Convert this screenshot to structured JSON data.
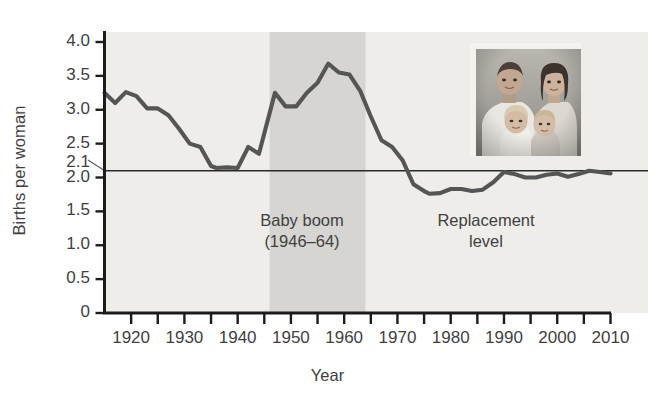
{
  "figure": {
    "background_color": "#ffffff",
    "plot_background_color": "#eeedea",
    "band_color": "#d6d5d2",
    "line_color": "#555555",
    "axis_color": "#1c1c1c",
    "text_color": "#3f3f3f"
  },
  "axis_titles": {
    "x": "Year",
    "y": "Births per woman"
  },
  "annotations": {
    "baby_boom_line1": "Baby boom",
    "baby_boom_line2": "(1946–64)",
    "replacement_line1": "Replacement",
    "replacement_line2": "level"
  },
  "photo": {
    "name": "family-portrait-photo",
    "caption": ""
  },
  "chart_data": {
    "type": "line",
    "title": "",
    "xlabel": "Year",
    "ylabel": "Births per woman",
    "xlim": [
      1915,
      2010
    ],
    "ylim": [
      0,
      4.2
    ],
    "grid": false,
    "legend": null,
    "x_ticks_major": [
      1920,
      1930,
      1940,
      1950,
      1960,
      1970,
      1980,
      1990,
      2000,
      2010
    ],
    "x_ticks_minor": [
      1925,
      1935,
      1945,
      1955,
      1965,
      1975,
      1985,
      1995,
      2005
    ],
    "x_tick_labels": [
      "1920",
      "1930",
      "1940",
      "1950",
      "1960",
      "1970",
      "1980",
      "1990",
      "2000",
      "2010"
    ],
    "y_ticks": [
      0,
      0.5,
      1.0,
      1.5,
      2.0,
      2.5,
      3.0,
      3.5,
      4.0
    ],
    "y_tick_labels": [
      "0",
      "0.5",
      "1.0",
      "1.5",
      "2.0",
      "2.5",
      "3.0",
      "3.5",
      "4.0"
    ],
    "y_extra_tick": 2.1,
    "y_extra_tick_label": "2.1",
    "reference_line": {
      "label": "Replacement level",
      "value": 2.1,
      "orientation": "horizontal"
    },
    "shaded_band": {
      "label": "Baby boom",
      "x_start": 1946,
      "x_end": 1964
    },
    "series": [
      {
        "name": "Total fertility rate",
        "x": [
          1915,
          1917,
          1919,
          1921,
          1923,
          1925,
          1927,
          1929,
          1931,
          1933,
          1935,
          1936,
          1938,
          1940,
          1942,
          1944,
          1946,
          1947,
          1949,
          1951,
          1953,
          1955,
          1957,
          1959,
          1961,
          1963,
          1965,
          1967,
          1969,
          1971,
          1973,
          1975,
          1976,
          1978,
          1980,
          1982,
          1984,
          1986,
          1988,
          1990,
          1992,
          1994,
          1996,
          1998,
          2000,
          2002,
          2004,
          2006,
          2008,
          2010
        ],
        "y": [
          3.25,
          3.1,
          3.26,
          3.2,
          3.02,
          3.02,
          2.92,
          2.72,
          2.5,
          2.45,
          2.17,
          2.14,
          2.15,
          2.14,
          2.45,
          2.35,
          2.95,
          3.25,
          3.05,
          3.05,
          3.25,
          3.4,
          3.68,
          3.55,
          3.52,
          3.28,
          2.9,
          2.55,
          2.45,
          2.25,
          1.9,
          1.8,
          1.76,
          1.77,
          1.83,
          1.83,
          1.8,
          1.82,
          1.93,
          2.08,
          2.05,
          2.0,
          2.0,
          2.04,
          2.06,
          2.01,
          2.05,
          2.1,
          2.08,
          2.06
        ]
      }
    ]
  }
}
